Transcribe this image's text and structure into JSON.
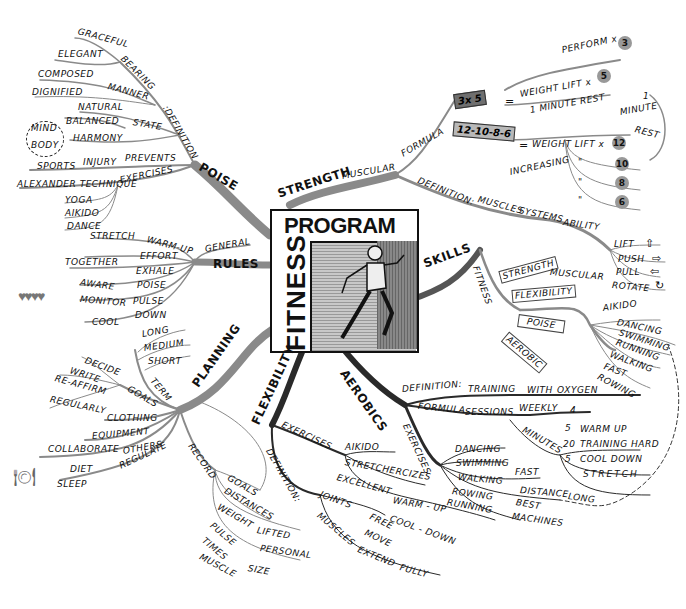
{
  "title": {
    "line1": "PROGRAM",
    "line2": "FITNESS",
    "illustration": "running-man"
  },
  "branches": {
    "poise": {
      "label": "POISE",
      "definition": {
        "label": ":DEFINITION",
        "bearing": {
          "label": "BEARING",
          "items": [
            "GRACEFUL",
            "ELEGANT"
          ]
        },
        "manner": {
          "label": "MANNER",
          "items": [
            "COMPOSED",
            "DIGNIFIED"
          ]
        },
        "state": {
          "label": "STATE",
          "items": [
            "NATURAL",
            "BALANCED",
            "HARMONY"
          ]
        },
        "mind_body": [
          "MIND",
          "BODY"
        ]
      },
      "prevents": {
        "label": "PREVENTS",
        "injury": "INJURY",
        "sports": "SPORTS"
      },
      "exercises": {
        "label": "EXERCISES",
        "items": [
          "ALEXANDER TECHNIQUE",
          "YOGA",
          "AIKIDO",
          "DANCE"
        ]
      }
    },
    "rules": {
      "label": "RULES",
      "general": "GENERAL",
      "items": [
        {
          "label": "WARM-UP",
          "sub": "STRETCH"
        },
        {
          "label": "EFFORT",
          "sub": ""
        },
        {
          "label": "EXHALE",
          "sub": "TOGETHER"
        },
        {
          "label": "POISE",
          "sub": "AWARE"
        },
        {
          "label": "PULSE",
          "sub": "MONITOR"
        },
        {
          "label": "DOWN",
          "sub": "COOL"
        }
      ]
    },
    "planning": {
      "label": "PLANNING",
      "term": {
        "label": "TERM",
        "items": [
          "LONG",
          "MEDIUM",
          "SHORT"
        ]
      },
      "goals": {
        "label": "GOALS",
        "items": [
          "DECIDE",
          "WRITE",
          "RE-AFFIRM",
          "REGULARLY"
        ]
      },
      "clothing": "CLOTHING",
      "equipment": "EQUIPMENT",
      "others": {
        "label": "OTHERS",
        "sub": "COLLABORATE"
      },
      "regulate": {
        "label": "REGULATE",
        "items": [
          "DIET",
          "SLEEP"
        ]
      },
      "record": {
        "label": "RECORD",
        "items": [
          "GOALS",
          "DISTANCES",
          "WEIGHT",
          "LIFTED",
          "PERSONAL",
          "PULSE",
          "TIMES",
          "MUSCLE",
          "SIZE"
        ]
      }
    },
    "strength": {
      "label": "STRENGTH",
      "muscular": "MUSCULAR",
      "formula": {
        "label": "FORMULA",
        "f1": {
          "box": "3x 5",
          "eq": "=",
          "weight_lift": "WEIGHT LIFT x",
          "times": "5",
          "perform": "PERFORM x",
          "perform_times": "3",
          "rest": "1 MINUTE REST"
        },
        "f2": {
          "box": "12-10-8-6",
          "eq": "=",
          "weight_lift": "WEIGHT LIFT x",
          "reps": [
            "12",
            "10",
            "8",
            "6"
          ],
          "ditto": "\"",
          "increasing": "INCREASING",
          "rest_num": "1",
          "rest_minute": "MINUTE",
          "rest_rest": "REST"
        }
      },
      "definition": {
        "label": "DEFINITION:",
        "muscles": "MUSCLES",
        "systems": "SYSTEMS",
        "ability": "ABILITY",
        "actions": [
          "LIFT",
          "PUSH",
          "PULL",
          "ROTATE"
        ]
      }
    },
    "skills": {
      "label": "SKILLS",
      "fitness": "FITNESS",
      "boxes": [
        "STRENGTH",
        "FLEXIBILITY",
        "POISE",
        "AEROBIC"
      ],
      "muscular": "MUSCULAR",
      "activities": [
        "AIKIDO",
        "DANCING",
        "SWIMMING",
        "RUNNING",
        "WALKING",
        "FAST",
        "ROWING"
      ]
    },
    "aerobics": {
      "label": "AEROBICS",
      "definition": {
        "label": "DEFINITION:",
        "items": [
          "TRAINING",
          "WITH",
          "OXYGEN"
        ]
      },
      "formula": {
        "label": "FORMULA",
        "sessions": "SESSIONS",
        "weekly": "WEEKLY",
        "weekly_value": "4",
        "minutes": "MINUTES",
        "parts": [
          {
            "n": "5",
            "label": "WARM UP"
          },
          {
            "n": "20",
            "label": "TRAINING HARD"
          },
          {
            "n": "5",
            "label": "COOL DOWN"
          }
        ],
        "stretch": "STRETCH"
      },
      "exercises": {
        "label": "EXERCISES",
        "items": [
          "DANCING",
          "SWIMMING",
          "WALKING",
          "ROWING",
          "RUNNING"
        ],
        "walking_sub": [
          "FAST",
          "DISTANCE",
          "LONG"
        ],
        "rowing_running_sub": [
          "BEST",
          "MACHINES"
        ]
      }
    },
    "flexibility": {
      "label": "FLEXIBILITY",
      "exercises": {
        "label": "EXERCISES",
        "items": [
          "AIKIDO",
          "STRETCHERCIZES"
        ],
        "excellent": "EXCELLENT",
        "uses": [
          "WARM - UP",
          "COOL - DOWN"
        ]
      },
      "definition": {
        "label": "DEFINITION:",
        "joints": "JOINTS",
        "joints_sub": [
          "FREE",
          "MOVE"
        ],
        "muscles": "MUSCLES",
        "extend": "EXTEND",
        "fully": "FULLY"
      }
    }
  },
  "colors": {
    "ink": "#111111",
    "branch_gray": "#8a8a8a",
    "branch_dark": "#2a2a2a",
    "box_dark": "#6f6f6f",
    "box_light": "#b8b8b8"
  }
}
